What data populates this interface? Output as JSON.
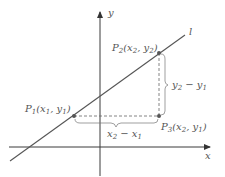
{
  "diagram": {
    "axes": {
      "x_label": "x",
      "y_label": "y"
    },
    "line": {
      "label": "l"
    },
    "points": [
      {
        "name": "P1",
        "letter": "P",
        "sub": "1",
        "coords_text": "(x",
        "coords": [
          "x1",
          "y1"
        ],
        "label_parts": {
          "a": "(x",
          "a_sub": "1",
          "sep": ", y",
          "b_sub": "1",
          "close": ")"
        }
      },
      {
        "name": "P2",
        "letter": "P",
        "sub": "2",
        "label_parts": {
          "a": "(x",
          "a_sub": "2",
          "sep": ", y",
          "b_sub": "2",
          "close": ")"
        }
      },
      {
        "name": "P3",
        "letter": "P",
        "sub": "3",
        "label_parts": {
          "a": "(x",
          "a_sub": "2",
          "sep": ", y",
          "b_sub": "1",
          "close": ")"
        }
      }
    ],
    "run_label": {
      "a": "x",
      "a_sub": "2",
      "minus": " − x",
      "b_sub": "1"
    },
    "rise_label": {
      "a": "y",
      "a_sub": "2",
      "minus": " − y",
      "b_sub": "1"
    },
    "colors": {
      "axis": "#3a3a3a",
      "line": "#555555",
      "dashed": "#666666",
      "dot": "#555555",
      "text": "#555555"
    }
  }
}
